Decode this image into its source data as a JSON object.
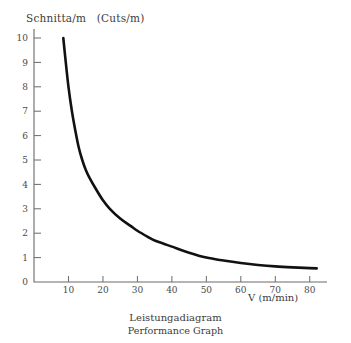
{
  "chart_data": {
    "type": "line",
    "title": "",
    "caption": {
      "german": "Leistungadiagram",
      "english": "Performance Graph"
    },
    "ylabel": "Schnitta/m",
    "ylabel_translation": "(Cuts/m)",
    "ylabel_full": "Schnitta/m   (Cuts/m)",
    "xlabel": "V (m/min)",
    "xlim": [
      0,
      85
    ],
    "ylim": [
      0,
      10.6
    ],
    "grid": false,
    "legend": null,
    "xticks": [
      10,
      20,
      30,
      40,
      50,
      60,
      70,
      80
    ],
    "xtick_labels": [
      "10",
      "20",
      "30",
      "40",
      "50",
      "60",
      "70",
      "80"
    ],
    "yticks": [
      0,
      1,
      2,
      3,
      4,
      5,
      6,
      7,
      8,
      9,
      10
    ],
    "ytick_labels": [
      "0",
      "1",
      "2",
      "3",
      "4",
      "5",
      "6",
      "7",
      "8",
      "9",
      "10"
    ],
    "series": [
      {
        "name": "Schnitta/m",
        "color": "#111111",
        "x": [
          8.5,
          9,
          10,
          11,
          12,
          13,
          14,
          15,
          16,
          18,
          20,
          22,
          25,
          28,
          30,
          33,
          35,
          38,
          40,
          45,
          50,
          55,
          60,
          65,
          70,
          75,
          80,
          82
        ],
        "y": [
          10.0,
          9.3,
          8.0,
          7.0,
          6.2,
          5.5,
          5.0,
          4.6,
          4.3,
          3.8,
          3.35,
          3.0,
          2.6,
          2.3,
          2.1,
          1.85,
          1.7,
          1.55,
          1.45,
          1.2,
          1.0,
          0.88,
          0.78,
          0.7,
          0.64,
          0.6,
          0.57,
          0.56
        ]
      }
    ]
  },
  "axes": {
    "y_axis_name": "cuts-per-meter-axis",
    "x_axis_name": "speed-axis"
  }
}
